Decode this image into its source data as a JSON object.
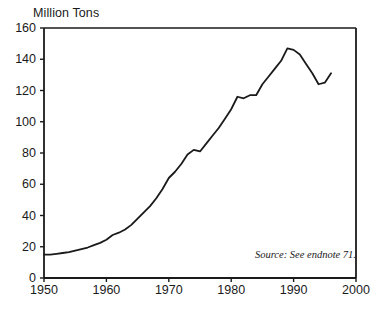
{
  "chart_data": {
    "type": "line",
    "title": "Million Tons",
    "xlabel": "",
    "ylabel": "Million Tons",
    "xlim": [
      1950,
      2000
    ],
    "ylim": [
      0,
      160
    ],
    "ytick_values": [
      0,
      20,
      40,
      60,
      80,
      100,
      120,
      140,
      160
    ],
    "ytick_labels": [
      "0",
      "20",
      "40",
      "60",
      "80",
      "100",
      "120",
      "140",
      "160"
    ],
    "xtick_values": [
      1950,
      1960,
      1970,
      1980,
      1990,
      2000
    ],
    "xtick_labels": [
      "1950",
      "1960",
      "1970",
      "1980",
      "1990",
      "2000"
    ],
    "grid": false,
    "legend": null,
    "line_color": "#1a1a1a",
    "frame_color": "#1a1a1a",
    "background": "#ffffff",
    "annotations": [
      {
        "name": "source-note",
        "text": "Source: See endnote 71.",
        "x": 1993,
        "y": 18
      }
    ],
    "series": [
      {
        "name": "Million Tons",
        "x": [
          1950,
          1951,
          1952,
          1953,
          1954,
          1955,
          1956,
          1957,
          1958,
          1959,
          1960,
          1961,
          1962,
          1963,
          1964,
          1965,
          1966,
          1967,
          1968,
          1969,
          1970,
          1971,
          1972,
          1973,
          1974,
          1975,
          1976,
          1977,
          1978,
          1979,
          1980,
          1981,
          1982,
          1983,
          1984,
          1985,
          1986,
          1987,
          1988,
          1989,
          1990,
          1991,
          1992,
          1993,
          1994,
          1995,
          1996
        ],
        "values": [
          15,
          15,
          15.5,
          16,
          16.5,
          17.5,
          18.5,
          19.5,
          21,
          22.5,
          24.5,
          27.5,
          29,
          31,
          34,
          38,
          42,
          46,
          51,
          57,
          64,
          68,
          73,
          79,
          82,
          81,
          86,
          91,
          96,
          102,
          108,
          116,
          115,
          117,
          117,
          124,
          129,
          134,
          139,
          147,
          146,
          143,
          137,
          131,
          124,
          125,
          131
        ]
      }
    ]
  },
  "plot_geometry": {
    "left_px": 44,
    "right_px": 356,
    "top_px": 28,
    "bottom_px": 278
  }
}
